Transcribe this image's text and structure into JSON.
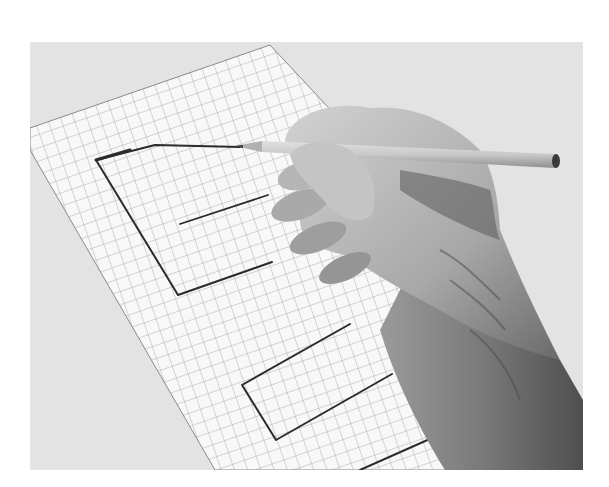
{
  "image": {
    "kind": "grayscale photograph",
    "subject": "hand drawing a rectilinear shape with a pencil on graph paper",
    "colors": {
      "page_background": "#ffffff",
      "photo_background": "#e3e3e3",
      "paper": "#f7f7f7",
      "grid_line": "#9a9a9a",
      "drawn_line": "#2a2a2a",
      "pencil_body": "#cfcfcf",
      "skin_light": "#c8c8c8",
      "skin_shadow": "#6a6a6a"
    }
  }
}
